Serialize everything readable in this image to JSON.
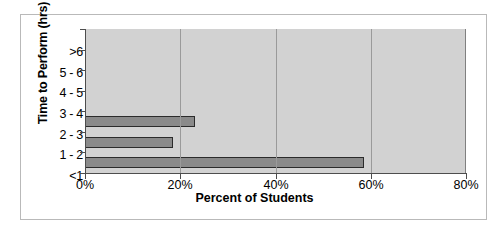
{
  "chart_data": {
    "type": "bar",
    "orientation": "horizontal",
    "title": "",
    "xlabel": "Percent of Students",
    "ylabel": "Time to Perform (hrs)",
    "categories": [
      "<1",
      "1 - 2",
      "2 - 3",
      "3 - 4",
      "4 - 5",
      "5 - 6",
      ">6"
    ],
    "values": [
      58.5,
      18.5,
      23.0,
      0,
      0,
      0,
      0
    ],
    "xlim": [
      0,
      80
    ],
    "xticks": [
      0,
      20,
      40,
      60,
      80
    ],
    "xtick_labels": [
      "0%",
      "20%",
      "40%",
      "60%",
      "80%"
    ],
    "grid": "vertical",
    "legend": "none",
    "plot_background": "#d2d2d2",
    "bar_fill": "#8a8a8a",
    "bar_border": "#2b2b2b"
  }
}
